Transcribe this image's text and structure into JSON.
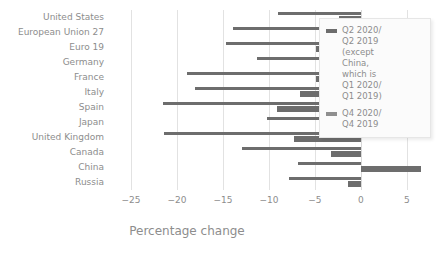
{
  "chart_data": {
    "type": "bar",
    "orientation": "horizontal",
    "title": "",
    "xlabel": "Percentage change",
    "ylabel": "",
    "xlim": [
      -27.5,
      8.5
    ],
    "xticks": [
      -25,
      -20,
      -15,
      -10,
      -5,
      0,
      5
    ],
    "xticklabels": [
      "−25",
      "−20",
      "−15",
      "−10",
      "−5",
      "0",
      "5"
    ],
    "grid": true,
    "grid_axis": "x",
    "legend_position": "upper right",
    "categories": [
      "United States",
      "European Union 27",
      "Euro 19",
      "Germany",
      "France",
      "Italy",
      "Spain",
      "Japan",
      "United Kingdom",
      "Canada",
      "China",
      "Russia"
    ],
    "series": [
      {
        "name": "Q2 2020/\nQ2 2019\n(except\nChina,\nwhich is\nQ1 2020/\nQ1 2019)",
        "color": "#6d6d6d",
        "values": [
          -9.0,
          -13.9,
          -14.7,
          -11.3,
          -18.9,
          -18.0,
          -21.5,
          -10.2,
          -21.4,
          -12.9,
          -6.8,
          -7.8
        ]
      },
      {
        "name": "Q4 2020/\nQ4 2019",
        "color": "#6d6d6d",
        "values": [
          -2.4,
          -4.6,
          -4.9,
          -3.7,
          -4.9,
          -6.6,
          -9.1,
          -1.0,
          -7.3,
          -3.2,
          6.5,
          -1.4
        ]
      }
    ]
  },
  "legend": {
    "entries": [
      {
        "label": "Q2 2020/\nQ2 2019\n(except\nChina,\nwhich is\nQ1 2020/\nQ1 2019)"
      },
      {
        "label": "Q4 2020/\nQ4 2019"
      }
    ]
  },
  "colors": {
    "bar": "#6d6d6d",
    "grid": "#e2e2e2",
    "text": "#8d8d8d",
    "background": "#ffffff"
  }
}
